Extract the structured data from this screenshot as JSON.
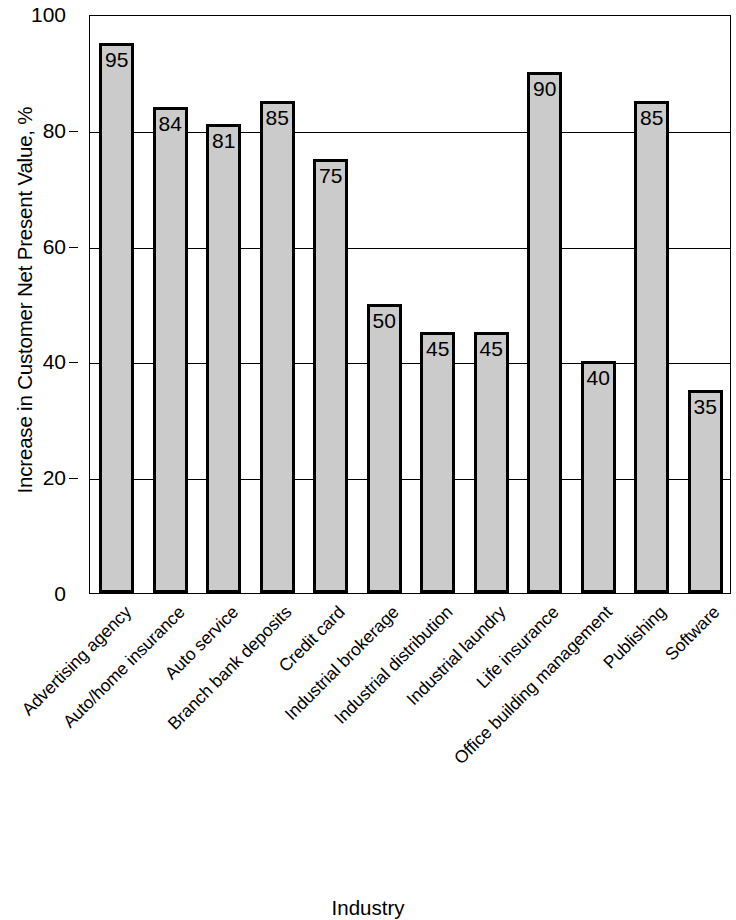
{
  "chart_data": {
    "type": "bar",
    "title": "",
    "xlabel": "Industry",
    "ylabel": "Increase in Customer Net Present Value, %",
    "ylim": [
      0,
      100
    ],
    "ytick_labels": [
      "0",
      "20",
      "40",
      "60",
      "80",
      "100"
    ],
    "ytick_values": [
      0,
      20,
      40,
      60,
      80,
      100
    ],
    "grid": true,
    "legend": null,
    "bar_fill_color": "#cbcbcb",
    "bar_edge_color": "#000000",
    "categories": [
      "Advertising agency",
      "Auto/home insurance",
      "Auto service",
      "Branch bank deposits",
      "Credit card",
      "Industrial brokerage",
      "Industrial distribution",
      "Industrial laundry",
      "Life insurance",
      "Office building management",
      "Publishing",
      "Software"
    ],
    "values": [
      95,
      84,
      81,
      85,
      75,
      50,
      45,
      45,
      90,
      40,
      85,
      35
    ],
    "value_labels": [
      "95",
      "84",
      "81",
      "85",
      "75",
      "50",
      "45",
      "45",
      "90",
      "40",
      "85",
      "35"
    ]
  }
}
